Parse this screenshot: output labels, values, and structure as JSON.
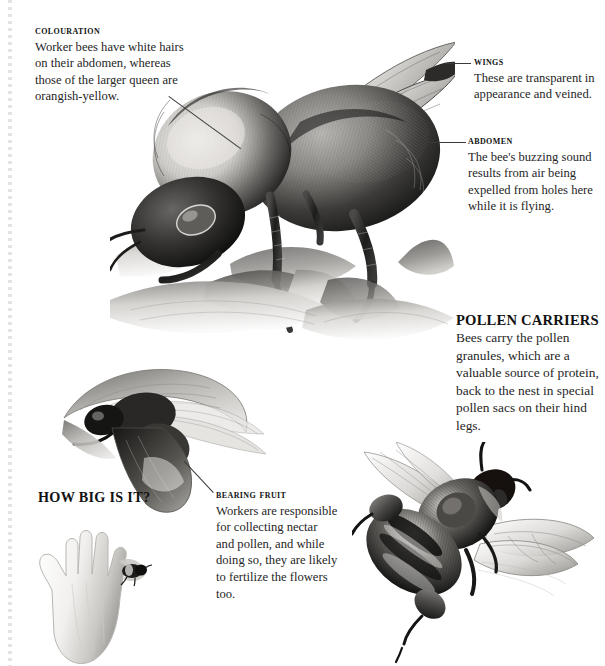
{
  "page": {
    "background": "#ffffff",
    "width": 605,
    "height": 666,
    "edge_marker": "dotted-perforation-rule"
  },
  "callouts": [
    {
      "id": "colouration",
      "heading": "Colouration",
      "body": "Worker bees have white hairs on their abdomen, whereas those of the larger queen are orangish-yellow.",
      "style": "small-caps-serif",
      "leader": "diagonal-down-right-to-thorax"
    },
    {
      "id": "wings",
      "heading": "Wings",
      "body": "These are transparent in appearance and veined.",
      "style": "small-caps-serif",
      "leader": "horizontal-left-to-wing-tip"
    },
    {
      "id": "abdomen",
      "heading": "Abdomen",
      "body": "The bee's buzzing sound results from air being expelled from holes here while it is flying.",
      "style": "small-caps-serif",
      "leader": "horizontal-left-to-abdomen"
    },
    {
      "id": "pollen-carriers",
      "heading": "POLLEN CARRIERS",
      "body": "Bees carry the pollen granules, which are a valuable source of protein, back to the nest in special pollen sacs on their hind legs.",
      "style": "bold-allcaps-serif",
      "leader": "none"
    },
    {
      "id": "bearing-fruit",
      "heading": "Bearing fruit",
      "body": "Workers are responsible for collecting nectar and pollen, and while doing so, they are likely to fertilize the flowers too.",
      "style": "small-caps-serif",
      "leader": "diagonal-up-left-to-flower-bee"
    }
  ],
  "scale_section": {
    "label": "HOW BIG IS IT?",
    "comparison_items": [
      "human-hand-silhouette",
      "bee-to-scale"
    ]
  },
  "illustrations": [
    {
      "id": "main-bee-on-flower",
      "caption_subject": "bumblebee perched on an open flower",
      "medium": "grayscale-engraving"
    },
    {
      "id": "bee-in-tubular-flower",
      "caption_subject": "bee entering a tubular blossom",
      "medium": "grayscale-engraving"
    },
    {
      "id": "flying-bee-pollen-sacs",
      "caption_subject": "bumblebee in flight with pollen sacs on hind legs",
      "medium": "grayscale-engraving"
    },
    {
      "id": "hand-silhouette",
      "caption_subject": "open human hand for size comparison",
      "medium": "grayscale-silhouette"
    },
    {
      "id": "scale-bee",
      "caption_subject": "small bee shown at true relative size",
      "medium": "grayscale-engraving"
    }
  ],
  "colors": {
    "ink": "#1a1a1a",
    "body_text": "#262626",
    "leader_line": "#3a3a3a",
    "perforation": "#e3e3e3",
    "background": "#ffffff"
  }
}
